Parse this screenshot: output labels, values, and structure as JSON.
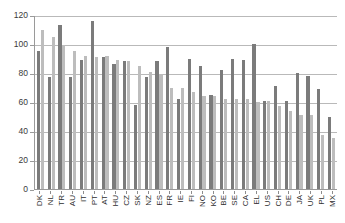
{
  "chart_data": {
    "type": "bar",
    "title": "",
    "subtitle": "",
    "xlabel": "",
    "ylabel": "",
    "ylim": [
      0,
      120
    ],
    "yticks": [
      0,
      20,
      40,
      60,
      80,
      100,
      120
    ],
    "grid": true,
    "legend": "none",
    "categories": [
      "DK",
      "NL",
      "TR",
      "AU",
      "IT",
      "PT",
      "AT",
      "HU",
      "CZ",
      "SK",
      "NZ",
      "ES",
      "FR",
      "IE",
      "FI",
      "NO",
      "KO",
      "BE",
      "SE",
      "CA",
      "EL",
      "US",
      "CH",
      "DE",
      "JA",
      "UK",
      "PL",
      "MX"
    ],
    "series": [
      {
        "name": "Series 1",
        "color": "#7b7b7b",
        "values": [
          95,
          77,
          113,
          77,
          89,
          116,
          91,
          86,
          88,
          58,
          77,
          88,
          98,
          62,
          90,
          85,
          65,
          82,
          90,
          89,
          100,
          61,
          71,
          61,
          80,
          78,
          69,
          50
        ]
      },
      {
        "name": "Series 2",
        "color": "#bdbdbd",
        "values": [
          110,
          105,
          99,
          95,
          92,
          91,
          92,
          89,
          88,
          85,
          81,
          79,
          70,
          70,
          67,
          64,
          64,
          62,
          62,
          62,
          60,
          61,
          57,
          54,
          51,
          51,
          37,
          35
        ]
      }
    ]
  }
}
